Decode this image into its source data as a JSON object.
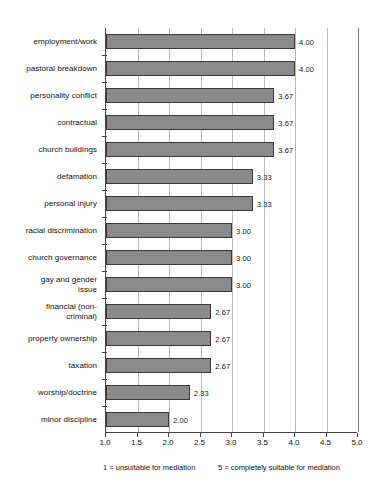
{
  "chart_data": {
    "type": "bar",
    "orientation": "horizontal",
    "title": "",
    "xlabel": "",
    "ylabel": "",
    "xlim": [
      1.0,
      5.0
    ],
    "grid": true,
    "legend": "none",
    "categories": [
      "employment/work",
      "pastoral breakdown",
      "personality conflict",
      "contractual",
      "church buildings",
      "defamation",
      "personal injury",
      "racial discrimination",
      "church governance",
      "gay and gender\nissue",
      "financial (non-\ncriminal)",
      "property ownership",
      "taxation",
      "worship/doctrine",
      "minor discipline"
    ],
    "values": [
      4.0,
      4.0,
      3.67,
      3.67,
      3.67,
      3.33,
      3.33,
      3.0,
      3.0,
      3.0,
      2.67,
      2.67,
      2.67,
      2.33,
      2.0
    ],
    "value_labels": [
      "4.00",
      "4.00",
      "3.67",
      "3.67",
      "3.67",
      "3.33",
      "3.33",
      "3.00",
      "3.00",
      "3.00",
      "2.67",
      "2.67",
      "2.67",
      "2.33",
      "2.00"
    ],
    "xticks": [
      1.0,
      1.5,
      2.0,
      2.5,
      3.0,
      3.5,
      4.0,
      4.5,
      5.0
    ],
    "xtick_labels": [
      "1.0",
      "1.5",
      "2.0",
      "2.5",
      "3.0",
      "3.5",
      "4.0",
      "4.5",
      "5.0"
    ],
    "annotations": {
      "left_note": "1 = unsuitable for mediation",
      "right_note": "5 = completely suitable for mediation"
    },
    "colors": {
      "bar_fill": "#8a8a8a",
      "bar_border": "#3a3a3a",
      "gridline": "#b9b9b9",
      "axis": "#444444",
      "text": "#111111",
      "background": "#ffffff"
    }
  }
}
